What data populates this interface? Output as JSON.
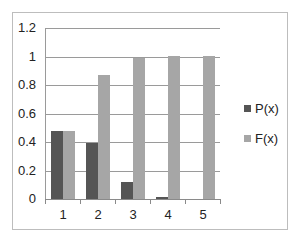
{
  "chart_data": {
    "type": "bar",
    "title": "",
    "xlabel": "",
    "ylabel": "",
    "categories": [
      "1",
      "2",
      "3",
      "4",
      "5"
    ],
    "series": [
      {
        "name": "P(x)",
        "color": "#555555",
        "values": [
          0.48,
          0.39,
          0.12,
          0.015,
          0.0
        ]
      },
      {
        "name": "F(x)",
        "color": "#a6a6a6",
        "values": [
          0.48,
          0.87,
          0.99,
          1.0,
          1.0
        ]
      }
    ],
    "yticks": [
      "0",
      "0.2",
      "0.4",
      "0.6",
      "0.8",
      "1",
      "1.2"
    ],
    "ylim": [
      0,
      1.2
    ],
    "grid": true,
    "legend_position": "right"
  }
}
